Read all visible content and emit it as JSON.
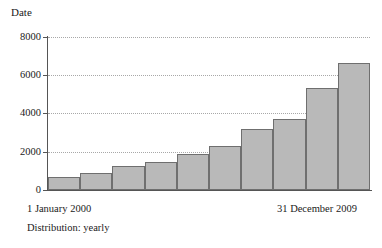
{
  "chart_data": {
    "type": "bar",
    "title": "Date",
    "xlabel": "",
    "ylabel": "",
    "ylim": [
      0,
      8000
    ],
    "yticks": [
      0,
      2000,
      4000,
      6000,
      8000
    ],
    "ytick_labels": [
      "0",
      "2000",
      "4000",
      "6000",
      "8000"
    ],
    "grid": true,
    "legend": null,
    "categories": [
      "2000",
      "2001",
      "2002",
      "2003",
      "2004",
      "2005",
      "2006",
      "2007",
      "2008",
      "2009"
    ],
    "values": [
      670,
      880,
      1250,
      1480,
      1880,
      2300,
      3190,
      3710,
      5330,
      6640
    ],
    "bar_color": "#b9b9b9",
    "bar_border_color": "#6f6f6f",
    "axis_color": "#555555",
    "grid_color": "#a8a8a8",
    "annotations": {
      "x_start": "1 January 2000",
      "x_end": "31 December 2009",
      "caption": "Distribution: yearly"
    }
  }
}
